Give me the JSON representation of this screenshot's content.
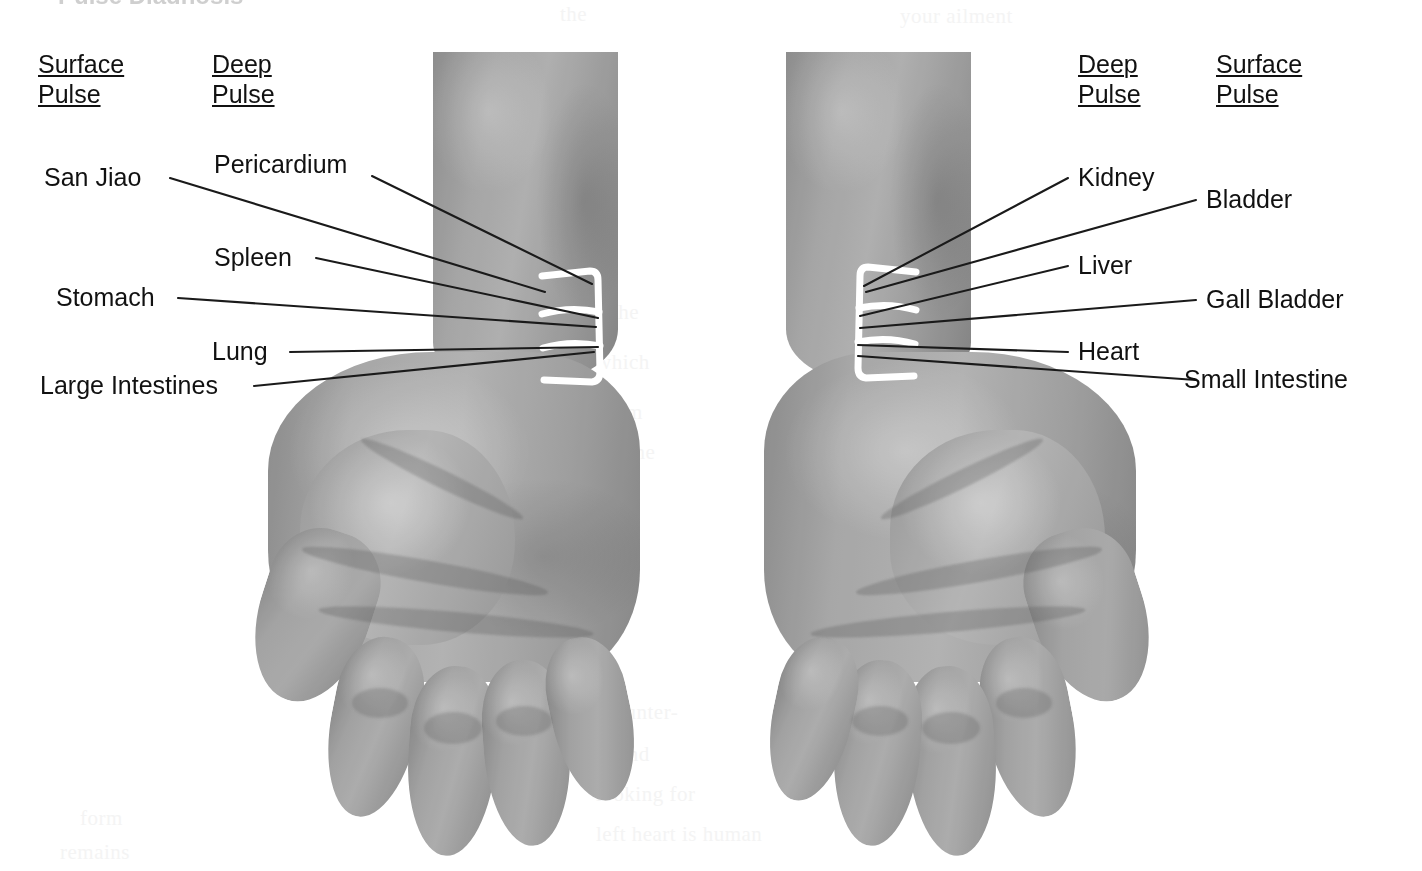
{
  "figure": {
    "title_fragment": "Pulse Diagnosis"
  },
  "headings": {
    "left_outer": {
      "line1": "Surface",
      "line2": "Pulse"
    },
    "left_inner": {
      "line1": "Deep",
      "line2": "Pulse"
    },
    "right_inner": {
      "line1": "Deep",
      "line2": "Pulse"
    },
    "right_outer": {
      "line1": "Surface",
      "line2": "Pulse"
    }
  },
  "left_hand": {
    "surface_pulse_labels": [
      {
        "name": "San Jiao"
      },
      {
        "name": "Stomach"
      },
      {
        "name": "Large Intestines"
      }
    ],
    "deep_pulse_labels": [
      {
        "name": "Pericardium"
      },
      {
        "name": "Spleen"
      },
      {
        "name": "Lung"
      }
    ]
  },
  "right_hand": {
    "deep_pulse_labels": [
      {
        "name": "Kidney"
      },
      {
        "name": "Liver"
      },
      {
        "name": "Heart"
      }
    ],
    "surface_pulse_labels": [
      {
        "name": "Bladder"
      },
      {
        "name": "Gall Bladder"
      },
      {
        "name": "Small Intestine"
      }
    ]
  },
  "labels": {
    "san_jiao": "San Jiao",
    "pericardium": "Pericardium",
    "spleen": "Spleen",
    "stomach": "Stomach",
    "lung": "Lung",
    "large_intestines": "Large Intestines",
    "kidney": "Kidney",
    "bladder": "Bladder",
    "liver": "Liver",
    "gall_bladder": "Gall Bladder",
    "heart": "Heart",
    "small_intestine": "Small Intestine"
  },
  "ghost_text": [
    {
      "text": "the",
      "x": 560,
      "y": 8
    },
    {
      "text": "your ailment",
      "x": 900,
      "y": 10
    },
    {
      "text": "the",
      "x": 612,
      "y": 300
    },
    {
      "text": "which",
      "x": 596,
      "y": 350
    },
    {
      "text": "form",
      "x": 600,
      "y": 400
    },
    {
      "text": "of the",
      "x": 604,
      "y": 440
    },
    {
      "text": "Counter-",
      "x": 600,
      "y": 700
    },
    {
      "text": "and",
      "x": 618,
      "y": 742
    },
    {
      "text": "looking for",
      "x": 596,
      "y": 782
    },
    {
      "text": "left heart is human",
      "x": 596,
      "y": 822
    },
    {
      "text": "form",
      "x": 80,
      "y": 806
    },
    {
      "text": "remains",
      "x": 60,
      "y": 840
    }
  ],
  "colors": {
    "ink": "#111111",
    "marking": "#ffffff",
    "skin_mid": "#a8a8a8",
    "background": "#ffffff"
  }
}
